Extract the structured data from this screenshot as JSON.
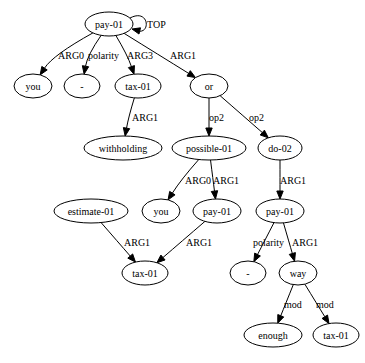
{
  "graph": {
    "type": "AMR",
    "nodes": [
      {
        "id": "n_pay_top",
        "label": "pay-01"
      },
      {
        "id": "n_you1",
        "label": "you"
      },
      {
        "id": "n_neg1",
        "label": "-"
      },
      {
        "id": "n_tax1",
        "label": "tax-01"
      },
      {
        "id": "n_or",
        "label": "or"
      },
      {
        "id": "n_withholding",
        "label": "withholding"
      },
      {
        "id": "n_possible",
        "label": "possible-01"
      },
      {
        "id": "n_do",
        "label": "do-02"
      },
      {
        "id": "n_estimate",
        "label": "estimate-01"
      },
      {
        "id": "n_you2",
        "label": "you"
      },
      {
        "id": "n_pay2",
        "label": "pay-01"
      },
      {
        "id": "n_pay3",
        "label": "pay-01"
      },
      {
        "id": "n_tax2",
        "label": "tax-01"
      },
      {
        "id": "n_neg2",
        "label": "-"
      },
      {
        "id": "n_way",
        "label": "way"
      },
      {
        "id": "n_enough",
        "label": "enough"
      },
      {
        "id": "n_tax3",
        "label": "tax-01"
      }
    ],
    "edges": [
      {
        "from": "n_pay_top",
        "to": "n_pay_top",
        "label": "TOP"
      },
      {
        "from": "n_pay_top",
        "to": "n_you1",
        "label": "ARG0"
      },
      {
        "from": "n_pay_top",
        "to": "n_neg1",
        "label": "polarity"
      },
      {
        "from": "n_pay_top",
        "to": "n_tax1",
        "label": "ARG3"
      },
      {
        "from": "n_pay_top",
        "to": "n_or",
        "label": "ARG1"
      },
      {
        "from": "n_tax1",
        "to": "n_withholding",
        "label": "ARG1"
      },
      {
        "from": "n_or",
        "to": "n_possible",
        "label": "op2"
      },
      {
        "from": "n_or",
        "to": "n_do",
        "label": "op2"
      },
      {
        "from": "n_possible",
        "to": "n_you2",
        "label": "ARG0"
      },
      {
        "from": "n_possible",
        "to": "n_pay2",
        "label": "ARG1"
      },
      {
        "from": "n_do",
        "to": "n_pay3",
        "label": "ARG1"
      },
      {
        "from": "n_estimate",
        "to": "n_tax2",
        "label": "ARG1"
      },
      {
        "from": "n_pay2",
        "to": "n_tax2",
        "label": "ARG1"
      },
      {
        "from": "n_pay3",
        "to": "n_neg2",
        "label": "polarity"
      },
      {
        "from": "n_pay3",
        "to": "n_way",
        "label": "ARG1"
      },
      {
        "from": "n_way",
        "to": "n_enough",
        "label": "mod"
      },
      {
        "from": "n_way",
        "to": "n_tax3",
        "label": "mod"
      }
    ]
  }
}
